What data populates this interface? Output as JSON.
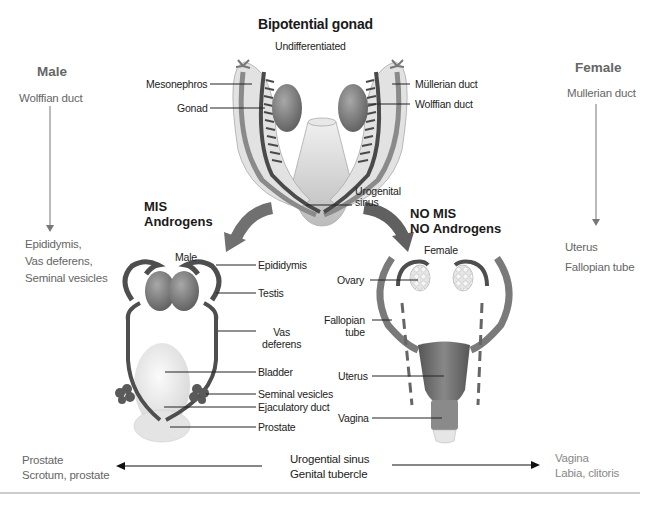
{
  "diagram": {
    "title": "Bipotential gonad",
    "subtitle": "Undifferentiated",
    "top_labels_left": [
      "Mesonephros",
      "Gonad"
    ],
    "top_labels_right": [
      "Müllerian duct",
      "Wolffian duct"
    ],
    "urogenital_label_1": "Urogenital",
    "urogenital_label_2": "sinus"
  },
  "male_column": {
    "heading": "Male",
    "origin": "Wolffian duct",
    "results": [
      "Epididymis,",
      "Vas deferens,",
      "Seminal vesicles"
    ]
  },
  "female_column": {
    "heading": "Female",
    "origin": "Mullerian duct",
    "results": [
      "Uterus",
      "Fallopian tube"
    ]
  },
  "male_pathway": {
    "condition_1": "MIS",
    "condition_2": "Androgens",
    "name": "Male",
    "labels": {
      "epididymis": "Epididymis",
      "testis": "Testis",
      "vas_1": "Vas",
      "vas_2": "deferens",
      "bladder": "Bladder",
      "seminal": "Seminal vesicles",
      "ejaculatory": "Ejaculatory duct",
      "prostate": "Prostate"
    }
  },
  "female_pathway": {
    "condition_1": "NO MIS",
    "condition_2": "NO Androgens",
    "name": "Female",
    "labels": {
      "ovary": "Ovary",
      "fallopian_1": "Fallopian",
      "fallopian_2": "tube",
      "uterus": "Uterus",
      "vagina": "Vagina"
    }
  },
  "bottom_row": {
    "center_1": "Urogential sinus",
    "center_2": "Genital tubercle",
    "left_1": "Prostate",
    "left_2": "Scrotum, prostate",
    "right_1": "Vagina",
    "right_2": "Labia, clitoris"
  },
  "colors": {
    "side_text": "#666666",
    "organ_dark": "#555555",
    "organ_mid": "#8a8a8a",
    "tissue_light": "#e2e2e2",
    "arrow": "#707070"
  }
}
